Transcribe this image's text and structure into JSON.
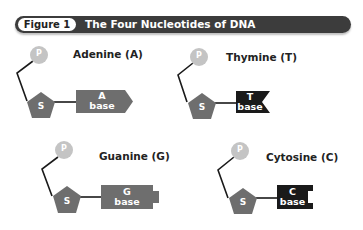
{
  "figure": {
    "number_label": "Figure 1",
    "title": "The Four Nucleotides of DNA"
  },
  "colors": {
    "header_bar": "#3c3c3c",
    "phosphate": "#c4c4c4",
    "sugar": "#6e6e6e",
    "purine_base": "#6e6e6e",
    "pyrimidine_base": "#1a1a1a",
    "bond_line": "#1a1a1a"
  },
  "nucleotides": [
    {
      "name": "Adenine (A)",
      "phosphate_label": "P",
      "sugar_label": "S",
      "base_letter": "A",
      "base_word": "base",
      "base_shape": "arrow"
    },
    {
      "name": "Thymine (T)",
      "phosphate_label": "P",
      "sugar_label": "S",
      "base_letter": "T",
      "base_word": "base",
      "base_shape": "v-notch"
    },
    {
      "name": "Guanine (G)",
      "phosphate_label": "P",
      "sugar_label": "S",
      "base_letter": "G",
      "base_word": "base",
      "base_shape": "tab"
    },
    {
      "name": "Cytosine (C)",
      "phosphate_label": "P",
      "sugar_label": "S",
      "base_letter": "C",
      "base_word": "base",
      "base_shape": "square-notch"
    }
  ]
}
